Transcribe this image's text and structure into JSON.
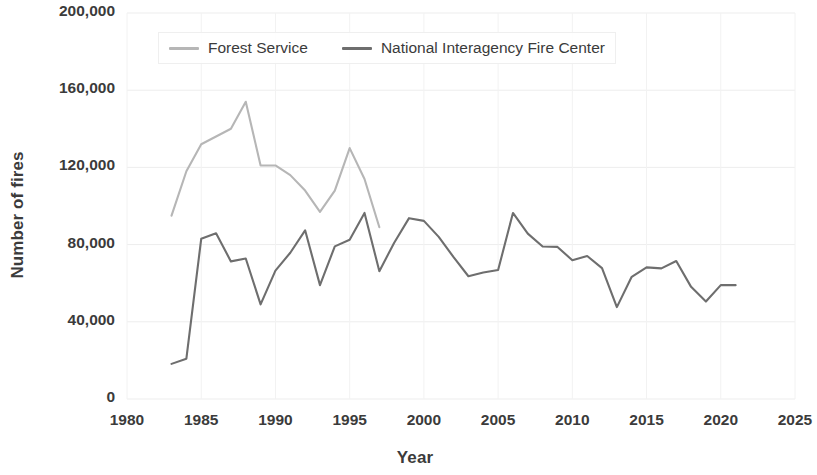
{
  "chart_data": {
    "type": "line",
    "title": "",
    "xlabel": "Year",
    "ylabel": "Number of fires",
    "xlim": [
      1980,
      2025
    ],
    "ylim": [
      0,
      200000
    ],
    "xticks": [
      1980,
      1985,
      1990,
      1995,
      2000,
      2005,
      2010,
      2015,
      2020,
      2025
    ],
    "xtick_labels": [
      "1980",
      "1985",
      "1990",
      "1995",
      "2000",
      "2005",
      "2010",
      "2015",
      "2020",
      "2025"
    ],
    "yticks": [
      0,
      40000,
      80000,
      120000,
      160000,
      200000
    ],
    "ytick_labels": [
      "0",
      "40,000",
      "80,000",
      "120,000",
      "160,000",
      "200,000"
    ],
    "grid": true,
    "legend_position": "top-center",
    "series": [
      {
        "name": "Forest Service",
        "color": "#b6b6b6",
        "x": [
          1983,
          1984,
          1985,
          1986,
          1987,
          1988,
          1989,
          1990,
          1991,
          1992,
          1993,
          1994,
          1995,
          1996,
          1997
        ],
        "values": [
          95000,
          118000,
          132000,
          136000,
          140000,
          154000,
          121000,
          121000,
          116000,
          108000,
          97000,
          108000,
          130000,
          114000,
          89000
        ]
      },
      {
        "name": "National Interagency Fire Center",
        "color": "#6e6e6e",
        "x": [
          1983,
          1984,
          1985,
          1986,
          1987,
          1988,
          1989,
          1990,
          1991,
          1992,
          1993,
          1994,
          1995,
          1996,
          1997,
          1998,
          1999,
          2000,
          2001,
          2002,
          2003,
          2004,
          2005,
          2006,
          2007,
          2008,
          2009,
          2010,
          2011,
          2012,
          2013,
          2014,
          2015,
          2016,
          2017,
          2018,
          2019,
          2020,
          2021
        ],
        "values": [
          18200,
          20900,
          83000,
          85900,
          71300,
          72800,
          49000,
          66500,
          75800,
          87400,
          59000,
          79100,
          82500,
          96400,
          66200,
          81000,
          93700,
          92300,
          84000,
          73500,
          63600,
          65500,
          66800,
          96400,
          85700,
          79000,
          78800,
          71900,
          74100,
          67800,
          47600,
          63300,
          68200,
          67700,
          71500,
          58100,
          50500,
          59000,
          59000
        ]
      }
    ]
  },
  "axis": {
    "ylabel": "Number of fires",
    "xlabel": "Year"
  },
  "legend": {
    "items": [
      {
        "label": "Forest Service",
        "color": "#b6b6b6"
      },
      {
        "label": "National Interagency Fire Center",
        "color": "#6e6e6e"
      }
    ]
  }
}
